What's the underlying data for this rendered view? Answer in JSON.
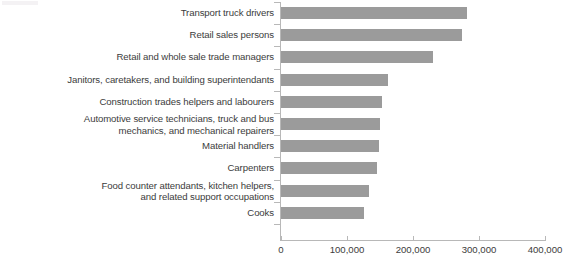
{
  "chart_data": {
    "type": "bar",
    "orientation": "horizontal",
    "title": "",
    "subtitle": "",
    "xlabel": "",
    "ylabel": "",
    "xlim": [
      0,
      400000
    ],
    "ylim": null,
    "grid": false,
    "legend": null,
    "legend_position": "none",
    "bar_color": "#9b9b9b",
    "text_color": "#3c3c3c",
    "axis_color": "#b8b8b8",
    "categories": [
      "Transport truck drivers",
      "Retail sales persons",
      "Retail and whole sale trade managers",
      "Janitors, caretakers, and building superintendants",
      "Construction trades helpers and labourers",
      "Automotive service technicians, truck and bus\nmechanics, and mechanical repairers",
      "Material handlers",
      "Carpenters",
      "Food counter attendants, kitchen helpers,\nand related support occupations",
      "Cooks"
    ],
    "values": [
      282000,
      274000,
      230000,
      162000,
      153000,
      150000,
      148000,
      145000,
      133000,
      125000
    ],
    "xticks": [
      0,
      100000,
      200000,
      300000,
      400000
    ],
    "xtick_labels": [
      "0",
      "100,000",
      "200,000",
      "300,000",
      "400,000"
    ]
  }
}
